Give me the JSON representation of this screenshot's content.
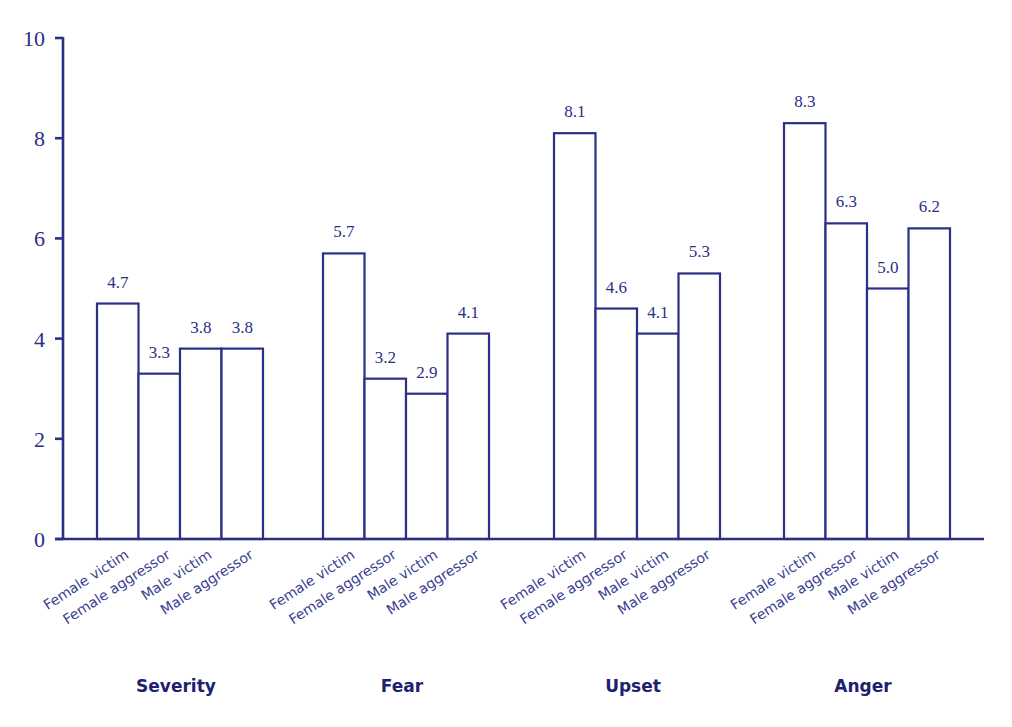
{
  "chart_data": {
    "type": "bar",
    "title": "",
    "xlabel": "",
    "ylabel": "",
    "ylim": [
      0,
      10
    ],
    "yticks": [
      0,
      2,
      4,
      6,
      8,
      10
    ],
    "grid": false,
    "legend": null,
    "groups": [
      "Severity",
      "Fear",
      "Upset",
      "Anger"
    ],
    "categories": [
      "Female victim",
      "Female aggressor",
      "Male victim",
      "Male aggressor"
    ],
    "series": [
      {
        "name": "Severity",
        "values": [
          4.7,
          3.3,
          3.8,
          3.8
        ]
      },
      {
        "name": "Fear",
        "values": [
          5.7,
          3.2,
          2.9,
          4.1
        ]
      },
      {
        "name": "Upset",
        "values": [
          8.1,
          4.6,
          4.1,
          5.3
        ]
      },
      {
        "name": "Anger",
        "values": [
          8.3,
          6.3,
          5.0,
          6.2
        ]
      }
    ],
    "value_labels": [
      [
        "4.7",
        "3.3",
        "3.8",
        "3.8"
      ],
      [
        "5.7",
        "3.2",
        "2.9",
        "4.1"
      ],
      [
        "8.1",
        "4.6",
        "4.1",
        "5.3"
      ],
      [
        "8.3",
        "6.3",
        "5.0",
        "6.2"
      ]
    ],
    "colors": {
      "bar_fill": "#ffffff",
      "bar_stroke": "#2b2f86",
      "text": "#2b2f86"
    }
  }
}
